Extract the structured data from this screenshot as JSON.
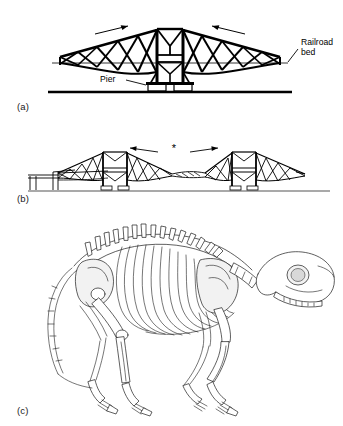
{
  "figure": {
    "background_color": "#ffffff",
    "ink_color": "#000000"
  },
  "panels": [
    {
      "id": "a",
      "label": "(a)",
      "caption_subject": "Single cantilever span of the Forth Bridge with central pier",
      "annotations": [
        {
          "name": "railroad-bed",
          "text_line_1": "Railroad",
          "text_line_2": "bed"
        },
        {
          "name": "pier",
          "text": "Pier"
        }
      ],
      "arrows": [
        {
          "name": "left-load-arrow",
          "direction": "right",
          "meaning": "load toward tower"
        },
        {
          "name": "right-load-arrow",
          "direction": "left",
          "meaning": "load toward tower"
        }
      ],
      "structure": {
        "tower_count": 1,
        "cantilever_arms": 2,
        "bracing": "X-braced tapering truss",
        "deck": "horizontal railroad bed line",
        "ground": "heavy horizontal ground line"
      }
    },
    {
      "id": "b",
      "label": "(b)",
      "caption_subject": "Complete Forth Bridge with two cantilever towers and suspended central span",
      "annotations": [
        {
          "name": "suspended-span-marker",
          "text": "*",
          "meaning": "central suspended span"
        }
      ],
      "arrows": [
        {
          "name": "left-span-arrow",
          "direction": "left",
          "meaning": "thrust toward tower"
        },
        {
          "name": "right-span-arrow",
          "direction": "right",
          "meaning": "thrust toward tower"
        }
      ],
      "structure": {
        "tower_count": 2,
        "approach_viaduct": "left end",
        "bracing": "X-braced tapering truss",
        "ground": "horizontal ground line"
      }
    },
    {
      "id": "c",
      "label": "(c)",
      "caption_subject": "Quadruped mammal skeleton in lateral view, facing right",
      "annotations": [],
      "structure": {
        "orientation": "facing right",
        "features": [
          "arched vertebral column",
          "neural spines over thorax",
          "rib cage",
          "scapula",
          "pelvis",
          "long curving tail",
          "fore and hind limbs",
          "skull with large orbit"
        ]
      }
    }
  ]
}
